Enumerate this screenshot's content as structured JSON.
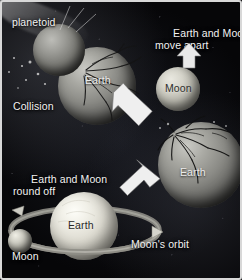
{
  "figure": {
    "background_color": "#07070a",
    "border_color": "#d8d8d8",
    "label_color": "#f2f2f2"
  },
  "labels": {
    "planetoid": "planetoid",
    "earth_collision": "Earth",
    "collision": "Collision",
    "move_apart": "Earth and Moon\nmove apart",
    "moon_ball": "Moon",
    "earth_damaged": "Earth",
    "round_off": "Earth and Moon\nround off",
    "earth_final": "Earth",
    "moons_orbit": "Moon's orbit",
    "moon_small": "Moon"
  },
  "stages": [
    {
      "id": "collision",
      "caption": "Collision",
      "bodies": [
        "planetoid",
        "Earth"
      ],
      "position": "top-left"
    },
    {
      "id": "move-apart",
      "caption": "Earth and Moon move apart",
      "bodies": [
        "Moon",
        "Earth"
      ],
      "position": "top-right"
    },
    {
      "id": "round-off",
      "caption": "Earth and Moon round off",
      "bodies": [
        "Earth",
        "Moon"
      ],
      "position": "bottom-left"
    }
  ],
  "arrows": [
    {
      "name": "arrow-collision-to-moon",
      "direction": "down-right"
    },
    {
      "name": "arrow-moon-move-apart",
      "direction": "up"
    },
    {
      "name": "arrow-to-round-off",
      "direction": "down-left"
    },
    {
      "name": "arrow-moon-orbit",
      "direction": "right"
    }
  ],
  "orbit": {
    "label": "Moon's orbit",
    "shape": "ellipse"
  }
}
